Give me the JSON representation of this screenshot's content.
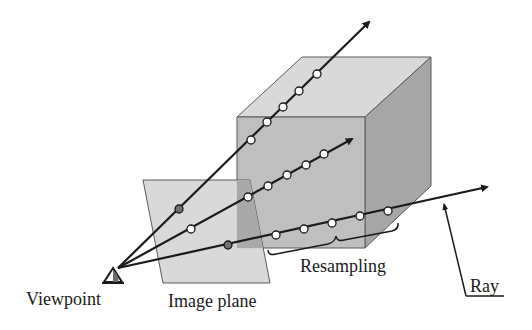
{
  "diagram": {
    "type": "ray-casting volume rendering illustration",
    "labels": {
      "viewpoint": "Viewpoint",
      "image_plane": "Image plane",
      "resampling": "Resampling",
      "ray": "Ray"
    },
    "colors": {
      "background": "#ffffff",
      "cube_top": "#d9d9d9",
      "cube_front": "#bfbfbf",
      "cube_side": "#a6a6a6",
      "image_plane": "#d6d6d6",
      "overlap": "#a9a9a9",
      "ray": "#1a1a1a",
      "sample_point_fill": "#ffffff",
      "pixel_point_fill": "#707070",
      "edge": "#5a5a5a"
    },
    "viewpoint": {
      "x": 118,
      "y": 268
    },
    "rays": [
      {
        "name": "upper-ray",
        "tip": [
          371,
          20
        ],
        "pixel_point": [
          179,
          209
        ],
        "sample_points": [
          [
            251,
            140
          ],
          [
            267,
            122
          ],
          [
            283,
            107
          ],
          [
            299,
            91
          ],
          [
            317,
            74
          ]
        ]
      },
      {
        "name": "middle-ray",
        "tip": [
          354,
          138
        ],
        "pixel_point": null,
        "sample_points": [
          [
            191,
            229
          ],
          [
            248,
            197
          ],
          [
            268,
            186
          ],
          [
            287,
            175
          ],
          [
            306,
            165
          ],
          [
            324,
            154
          ]
        ]
      },
      {
        "name": "lower-ray",
        "tip": [
          489,
          187
        ],
        "pixel_point": [
          228,
          245
        ],
        "sample_points": [
          [
            276,
            235
          ],
          [
            304,
            229
          ],
          [
            332,
            223
          ],
          [
            360,
            216
          ],
          [
            388,
            211
          ]
        ]
      }
    ]
  }
}
